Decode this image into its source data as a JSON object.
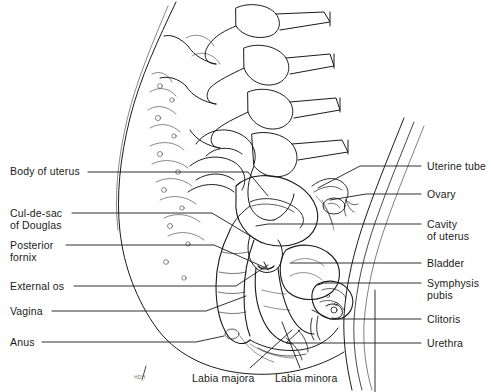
{
  "figure": {
    "type": "anatomical-line-drawing",
    "background_color": "#ffffff",
    "line_color": "#1a1a1a",
    "text_color": "#1a1a1a",
    "width": 491,
    "height": 392
  },
  "labels": {
    "left": [
      {
        "id": "body-of-uterus",
        "lines": [
          "Body of uterus"
        ],
        "x": 10,
        "y": 165,
        "leader_x_start": 88,
        "leader_y": 172,
        "leader_x_end": 248,
        "leader_tip_x": 268,
        "leader_tip_y": 196
      },
      {
        "id": "cul-de-sac-of-douglas",
        "lines": [
          "Cul-de-sac",
          "of Douglas"
        ],
        "x": 10,
        "y": 207,
        "leader_x_start": 72,
        "leader_y": 213,
        "leader_x_end": 212,
        "leader_tip_x": 262,
        "leader_tip_y": 243
      },
      {
        "id": "posterior-fornix",
        "lines": [
          "Posterior",
          "fornix"
        ],
        "x": 10,
        "y": 239,
        "leader_x_start": 66,
        "leader_y": 245,
        "leader_x_end": 214,
        "leader_tip_x": 266,
        "leader_tip_y": 268
      },
      {
        "id": "external-os",
        "lines": [
          "External os"
        ],
        "x": 10,
        "y": 280,
        "leader_x_start": 74,
        "leader_y": 286,
        "leader_x_end": 236,
        "leader_tip_x": 268,
        "leader_tip_y": 265
      },
      {
        "id": "vagina",
        "lines": [
          "Vagina"
        ],
        "x": 10,
        "y": 305,
        "leader_x_start": 52,
        "leader_y": 311,
        "leader_x_end": 206,
        "leader_tip_x": 246,
        "leader_tip_y": 296
      },
      {
        "id": "anus",
        "lines": [
          "Anus"
        ],
        "x": 10,
        "y": 336,
        "leader_x_start": 42,
        "leader_y": 342,
        "leader_x_end": 196,
        "leader_tip_x": 224,
        "leader_tip_y": 336
      }
    ],
    "right": [
      {
        "id": "uterine-tube",
        "lines": [
          "Uterine tube"
        ],
        "x": 427,
        "y": 160,
        "leader_x_start": 360,
        "leader_y": 166,
        "leader_x_end": 421,
        "leader_tip_x": 318,
        "leader_tip_y": 188
      },
      {
        "id": "ovary",
        "lines": [
          "Ovary"
        ],
        "x": 427,
        "y": 188,
        "leader_x_start": 366,
        "leader_y": 194,
        "leader_x_end": 421,
        "leader_tip_x": 330,
        "leader_tip_y": 200
      },
      {
        "id": "cavity-of-uterus",
        "lines": [
          "Cavity",
          "of uterus"
        ],
        "x": 427,
        "y": 218,
        "leader_x_start": 268,
        "leader_y": 224,
        "leader_x_end": 421,
        "leader_tip_x": 256,
        "leader_tip_y": 226
      },
      {
        "id": "bladder",
        "lines": [
          "Bladder"
        ],
        "x": 427,
        "y": 257,
        "leader_x_start": 300,
        "leader_y": 263,
        "leader_x_end": 421,
        "leader_tip_x": 290,
        "leader_tip_y": 263
      },
      {
        "id": "symphysis-pubis",
        "lines": [
          "Symphysis",
          "pubis"
        ],
        "x": 427,
        "y": 277,
        "leader_x_start": 324,
        "leader_y": 283,
        "leader_x_end": 421,
        "leader_tip_x": 318,
        "leader_tip_y": 285
      },
      {
        "id": "clitoris",
        "lines": [
          "Clitoris"
        ],
        "x": 427,
        "y": 313,
        "leader_x_start": 330,
        "leader_y": 319,
        "leader_x_end": 421,
        "leader_tip_x": 312,
        "leader_tip_y": 310
      },
      {
        "id": "urethra",
        " lines": [],
        "lines2": [],
        "x": 427,
        "y": 337,
        "leader_x_start": 286,
        "leader_y": 343,
        "leader_x_end": 421,
        "leader_tip_x": 300,
        "leader_tip_y": 330,
        "text": "Urethra"
      }
    ],
    "bottom": [
      {
        "id": "labia-majora",
        "lines": [
          "Labia majora"
        ],
        "x": 192,
        "y": 372,
        "leader_x_start": 250,
        "leader_y_start": 368,
        "leader_x_end": 292,
        "leader_y_end": 330
      },
      {
        "id": "labia-minora",
        "lines": [
          "Labia minora"
        ],
        "x": 275,
        "y": 372,
        "leader_x_start": 300,
        "leader_y_start": 368,
        "leader_x_end": 282,
        "leader_y_end": 322
      }
    ]
  },
  "signature": {
    "text": "HDH",
    "x": 134,
    "y": 374
  }
}
